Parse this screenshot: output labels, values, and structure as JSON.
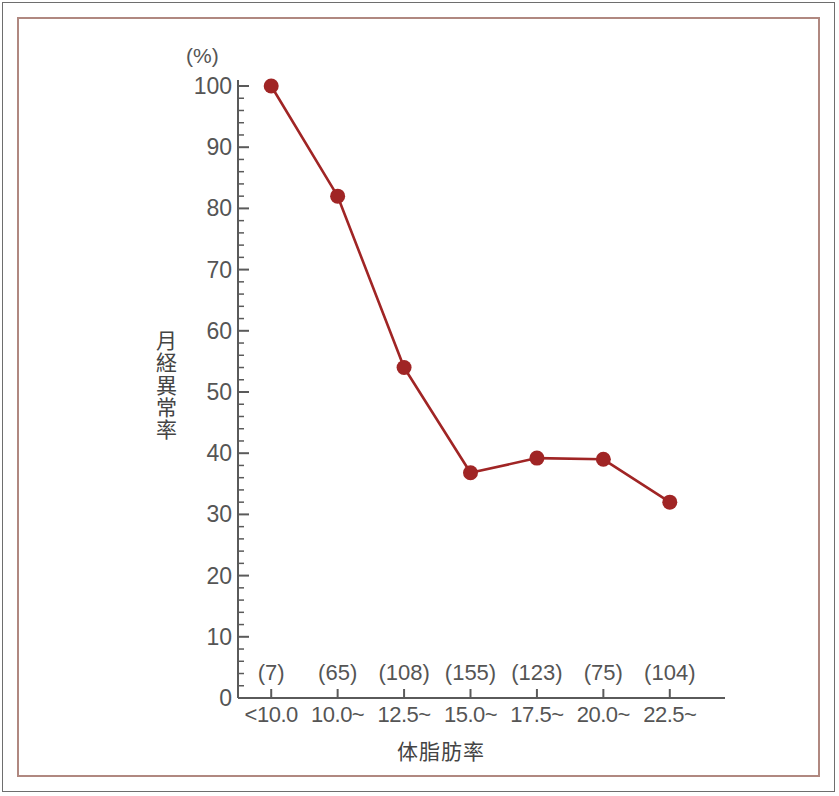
{
  "chart_data": {
    "type": "line",
    "title": "",
    "subtitle": "",
    "xlabel": "体脂肪率",
    "ylabel": "月経異常率",
    "yunit": "(%)",
    "categories": [
      "<10.0",
      "10.0~",
      "12.5~",
      "15.0~",
      "17.5~",
      "20.0~",
      "22.5~"
    ],
    "values": [
      100,
      82,
      54,
      36.8,
      39.2,
      39,
      32
    ],
    "sample_sizes": [
      "(7)",
      "(65)",
      "(108)",
      "(155)",
      "(123)",
      "(75)",
      "(104)"
    ],
    "ylim": [
      0,
      100
    ],
    "ytick_labels": [
      "0",
      "10",
      "20",
      "30",
      "40",
      "50",
      "60",
      "70",
      "80",
      "90",
      "100"
    ],
    "ytick_values": [
      0,
      10,
      20,
      30,
      40,
      50,
      60,
      70,
      80,
      90,
      100
    ],
    "yminor_step": 2,
    "grid": false,
    "legend": false,
    "legend_position": "none",
    "series": [
      {
        "name": "月経異常率",
        "values": [
          100,
          82,
          54,
          36.8,
          39.2,
          39,
          32
        ],
        "color": "#a02525",
        "marker": "circle"
      }
    ]
  },
  "colors": {
    "line": "#a02525",
    "marker": "#a02525",
    "axis": "#5a5a5a",
    "tick_text": "#555555",
    "inner_border": "#b08880",
    "outer_border": "#6e6e6e",
    "background": "#ffffff"
  },
  "yaxis_title_chars": [
    "月",
    "経",
    "異",
    "常",
    "率"
  ]
}
